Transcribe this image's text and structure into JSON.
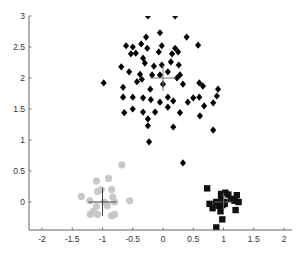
{
  "chart_data": {
    "type": "scatter",
    "title": "",
    "xlabel": "",
    "ylabel": "",
    "xlim": [
      -2.22,
      2.13
    ],
    "ylim": [
      -0.45,
      3.0
    ],
    "grid": false,
    "legend": null,
    "x_ticks": [
      -2,
      -1.5,
      -1,
      -0.5,
      0,
      0.5,
      1,
      1.5,
      2
    ],
    "x_tick_labels": [
      "-2",
      "-1.5",
      "-1",
      "-0.5",
      "0",
      "0.5",
      "1",
      "1.5",
      "2"
    ],
    "y_ticks": [
      0,
      0.5,
      1,
      1.5,
      2,
      2.5,
      3
    ],
    "y_tick_labels": [
      "0",
      "0.5",
      "1",
      "1.5",
      "2",
      "2.5",
      "3"
    ],
    "series": [
      {
        "name": "cluster-diamonds",
        "marker": "diamond",
        "color": "#000000",
        "centroid": [
          0.0,
          2.0
        ],
        "centroid_color": "#777777",
        "points": [
          [
            -0.25,
            3.0
          ],
          [
            0.2,
            3.0
          ],
          [
            -0.05,
            2.73
          ],
          [
            0.39,
            2.66
          ],
          [
            -0.28,
            2.66
          ],
          [
            -0.61,
            2.52
          ],
          [
            -0.5,
            2.5
          ],
          [
            -0.36,
            2.55
          ],
          [
            -0.26,
            2.48
          ],
          [
            -0.02,
            2.52
          ],
          [
            0.2,
            2.48
          ],
          [
            0.25,
            2.42
          ],
          [
            0.58,
            2.53
          ],
          [
            -0.53,
            2.39
          ],
          [
            -0.45,
            2.4
          ],
          [
            -0.07,
            2.42
          ],
          [
            0.15,
            2.39
          ],
          [
            -0.33,
            2.32
          ],
          [
            0.13,
            2.26
          ],
          [
            0.26,
            2.21
          ],
          [
            -0.69,
            2.18
          ],
          [
            -0.56,
            2.1
          ],
          [
            -0.3,
            2.24
          ],
          [
            -0.15,
            2.19
          ],
          [
            -0.02,
            2.21
          ],
          [
            -0.38,
            2.06
          ],
          [
            -0.18,
            2.05
          ],
          [
            -0.05,
            2.05
          ],
          [
            0.08,
            2.1
          ],
          [
            0.28,
            2.05
          ],
          [
            -0.98,
            1.92
          ],
          [
            -0.66,
            1.85
          ],
          [
            -0.43,
            1.94
          ],
          [
            -0.35,
            1.98
          ],
          [
            -0.21,
            1.82
          ],
          [
            0.0,
            1.9
          ],
          [
            0.23,
            2.0
          ],
          [
            0.33,
            1.9
          ],
          [
            0.6,
            1.92
          ],
          [
            0.66,
            1.87
          ],
          [
            0.91,
            1.82
          ],
          [
            -0.66,
            1.69
          ],
          [
            -0.5,
            1.69
          ],
          [
            -0.33,
            1.68
          ],
          [
            -0.2,
            1.65
          ],
          [
            -0.05,
            1.61
          ],
          [
            0.08,
            1.69
          ],
          [
            0.17,
            1.63
          ],
          [
            0.41,
            1.61
          ],
          [
            0.5,
            1.68
          ],
          [
            0.6,
            1.69
          ],
          [
            0.89,
            1.71
          ],
          [
            -0.64,
            1.44
          ],
          [
            -0.5,
            1.5
          ],
          [
            -0.33,
            1.45
          ],
          [
            -0.13,
            1.45
          ],
          [
            0.08,
            1.53
          ],
          [
            0.28,
            1.44
          ],
          [
            0.68,
            1.55
          ],
          [
            0.83,
            1.6
          ],
          [
            0.61,
            1.39
          ],
          [
            -0.25,
            1.34
          ],
          [
            -0.25,
            1.23
          ],
          [
            0.17,
            1.21
          ],
          [
            0.83,
            1.16
          ],
          [
            -0.23,
            0.97
          ],
          [
            0.33,
            0.63
          ]
        ]
      },
      {
        "name": "cluster-circles",
        "marker": "circle",
        "color": "#c8c8c8",
        "centroid": [
          -1.0,
          0.0
        ],
        "centroid_color": "#444444",
        "points": [
          [
            -0.68,
            0.6
          ],
          [
            -1.1,
            0.34
          ],
          [
            -0.9,
            0.38
          ],
          [
            -1.02,
            0.2
          ],
          [
            -0.85,
            0.2
          ],
          [
            -1.08,
            0.17
          ],
          [
            -1.35,
            0.09
          ],
          [
            -0.83,
            0.08
          ],
          [
            -0.55,
            0.02
          ],
          [
            -1.21,
            0.02
          ],
          [
            -0.97,
            0.0
          ],
          [
            -0.8,
            0.0
          ],
          [
            -1.1,
            -0.07
          ],
          [
            -0.92,
            -0.06
          ],
          [
            -1.15,
            -0.15
          ],
          [
            -1.2,
            -0.2
          ],
          [
            -1.08,
            -0.2
          ],
          [
            -0.85,
            -0.22
          ],
          [
            -0.8,
            -0.2
          ]
        ]
      },
      {
        "name": "cluster-squares",
        "marker": "square",
        "color": "#111111",
        "centroid": [
          1.0,
          0.0
        ],
        "centroid_color": "#666666",
        "points": [
          [
            0.73,
            0.22
          ],
          [
            0.96,
            0.13
          ],
          [
            1.03,
            0.15
          ],
          [
            1.08,
            0.12
          ],
          [
            1.22,
            0.11
          ],
          [
            1.12,
            0.05
          ],
          [
            1.25,
            0.0
          ],
          [
            1.18,
            0.02
          ],
          [
            0.88,
            0.0
          ],
          [
            0.96,
            0.04
          ],
          [
            1.01,
            0.0
          ],
          [
            0.77,
            -0.03
          ],
          [
            0.92,
            -0.06
          ],
          [
            0.98,
            -0.05
          ],
          [
            1.02,
            -0.03
          ],
          [
            0.82,
            -0.1
          ],
          [
            0.95,
            -0.15
          ],
          [
            1.2,
            -0.13
          ],
          [
            0.98,
            -0.28
          ],
          [
            0.88,
            -0.41
          ],
          [
            1.05,
            -0.52
          ],
          [
            1.28,
            -0.53
          ]
        ]
      }
    ]
  }
}
